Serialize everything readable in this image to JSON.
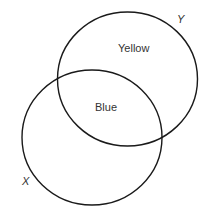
{
  "diagram": {
    "type": "venn",
    "sets": [
      {
        "name": "X",
        "label": "X"
      },
      {
        "name": "Y",
        "label": "Y"
      }
    ],
    "regions": {
      "y_only": "Yellow",
      "intersection": "Blue"
    },
    "stroke_color": "#1a1a1a"
  }
}
